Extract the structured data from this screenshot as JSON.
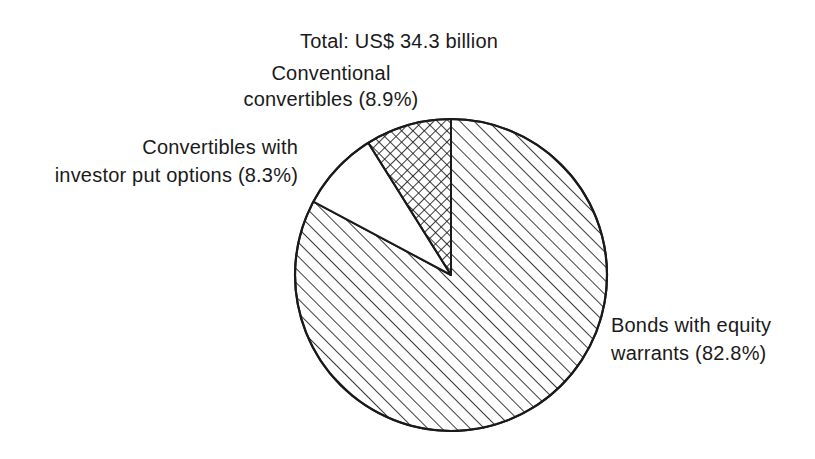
{
  "figure": {
    "title": "Total: US$ 34.3 billion",
    "labels": {
      "conventional": {
        "line1": "Conventional",
        "line2": "convertibles (8.9%)"
      },
      "put_options": {
        "line1": "Convertibles with",
        "line2": "investor put options (8.3%)"
      },
      "bonds": {
        "line1": "Bonds with equity",
        "line2": "warrants (82.8%)"
      }
    }
  },
  "chart_data": {
    "type": "pie",
    "title": "Total: US$ 34.3 billion",
    "total_value_text": "US$ 34.3 billion",
    "start_angle_deg": 0,
    "direction": "clockwise",
    "legend_position": "none",
    "ink_color": "#1a1a1a",
    "background_color": "#ffffff",
    "slices": [
      {
        "label": "Bonds with equity warrants",
        "pct": 82.8,
        "pattern": "diagonal-hatch"
      },
      {
        "label": "Convertibles with investor put options",
        "pct": 8.3,
        "pattern": "plain"
      },
      {
        "label": "Conventional convertibles",
        "pct": 8.9,
        "pattern": "crosshatch"
      }
    ]
  }
}
